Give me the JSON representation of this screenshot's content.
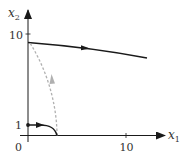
{
  "diagram": {
    "type": "phase-portrait",
    "axes": {
      "x": {
        "label": "x",
        "subscript": "1",
        "ticks": [
          {
            "value": 10,
            "label": "10"
          }
        ]
      },
      "y": {
        "label": "x",
        "subscript": "2",
        "ticks": [
          {
            "value": 1,
            "label": "1"
          },
          {
            "value": 10,
            "label": "10"
          }
        ]
      },
      "origin_label": "0"
    },
    "trajectories": [
      {
        "name": "upper-trajectory",
        "style": "solid",
        "direction": "right",
        "description": "Starts on x2-axis near 9.2 and decreases slowly as x1 increases"
      },
      {
        "name": "lower-trajectory",
        "style": "solid",
        "direction": "right",
        "description": "Starts at marked point (0,1) and curves down to the x1-axis near x1=3"
      },
      {
        "name": "dashed-trajectory",
        "style": "dashed",
        "direction": "up",
        "description": "Rises from x1-axis near x1=3 to meet the x2-axis near 9.2"
      }
    ],
    "colors": {
      "axis": "#1a1a1a",
      "solid_curve": "#1a1a1a",
      "dashed_curve": "#b0b0b0",
      "label": "#333333"
    }
  }
}
